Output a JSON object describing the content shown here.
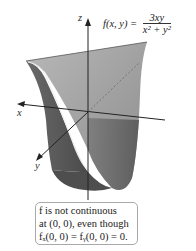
{
  "formula": {
    "lhs": "f(x, y) =",
    "numerator": "3xy",
    "denominator": "x² + y²"
  },
  "axes": {
    "z": "z",
    "x": "x",
    "y": "y"
  },
  "note": {
    "line1": "f is not continuous",
    "line2": "at (0, 0), even though",
    "line3": "fₓ(0, 0) = fᵧ(0, 0) = 0."
  },
  "colors": {
    "surface_light": "#a8a8a8",
    "surface_dark": "#5e5e5e",
    "axis": "#222222",
    "box_border": "#a9a9a9"
  }
}
